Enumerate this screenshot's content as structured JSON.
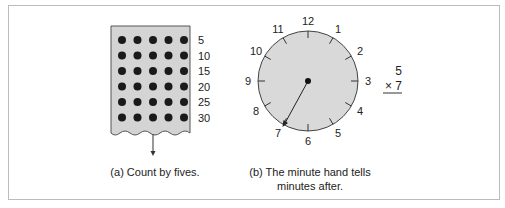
{
  "panel_a": {
    "caption": "(a) Count by fives.",
    "dot_rows": 6,
    "dot_cols": 5,
    "row_labels": [
      "5",
      "10",
      "15",
      "20",
      "25",
      "30"
    ],
    "colors": {
      "card": "#d4d4d4",
      "dot": "#1a1a1a",
      "border": "#555555"
    }
  },
  "panel_b": {
    "caption_line1": "(b) The minute hand tells",
    "caption_line2": "minutes after.",
    "clock_numbers": [
      "12",
      "1",
      "2",
      "3",
      "4",
      "5",
      "6",
      "7",
      "8",
      "9",
      "10",
      "11"
    ],
    "minute_hand_points_to": "7",
    "colors": {
      "face": "#d9d9d9",
      "rim": "#444444"
    }
  },
  "multiplication": {
    "top": "5",
    "bottom": "× 7"
  }
}
